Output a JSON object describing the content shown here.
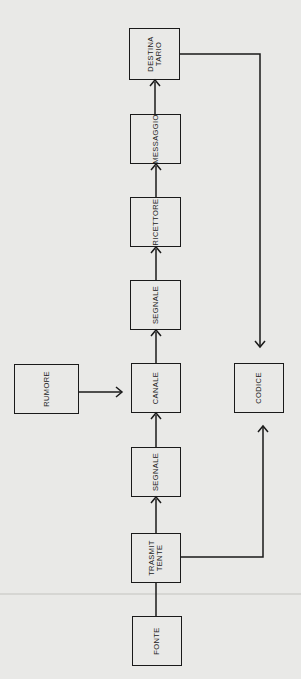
{
  "diagram": {
    "orientation": "rotated-90-ccw",
    "nodes": [
      {
        "id": "fonte",
        "label": [
          "FONTE"
        ],
        "x": 132,
        "y": 616,
        "w": 50,
        "h": 50
      },
      {
        "id": "trasmittente",
        "label": [
          "TRASMIT",
          "TENTE"
        ],
        "x": 131,
        "y": 533,
        "w": 50,
        "h": 50
      },
      {
        "id": "segnale1",
        "label": [
          "SEGNALE"
        ],
        "x": 131,
        "y": 447,
        "w": 50,
        "h": 50
      },
      {
        "id": "canale",
        "label": [
          "CANALE"
        ],
        "x": 131,
        "y": 363,
        "w": 50,
        "h": 50
      },
      {
        "id": "rumore",
        "label": [
          "RUMORE"
        ],
        "x": 14,
        "y": 364,
        "w": 65,
        "h": 50
      },
      {
        "id": "codice",
        "label": [
          "CODICE"
        ],
        "x": 234,
        "y": 363,
        "w": 50,
        "h": 50
      },
      {
        "id": "segnale2",
        "label": [
          "SEGNALE"
        ],
        "x": 130,
        "y": 280,
        "w": 51,
        "h": 50
      },
      {
        "id": "ricettore",
        "label": [
          "RICETTORE"
        ],
        "x": 130,
        "y": 197,
        "w": 51,
        "h": 50
      },
      {
        "id": "messaggio",
        "label": [
          "MESSAGGIO"
        ],
        "x": 130,
        "y": 114,
        "w": 51,
        "h": 50
      },
      {
        "id": "destinatario",
        "label": [
          "DESTINA",
          "TARIO"
        ],
        "x": 129,
        "y": 28,
        "w": 51,
        "h": 52
      }
    ],
    "edges": [
      {
        "from": "fonte",
        "to": "trasmittente",
        "arrow": false
      },
      {
        "from": "trasmittente",
        "to": "segnale1",
        "arrow": true
      },
      {
        "from": "segnale1",
        "to": "canale",
        "arrow": true
      },
      {
        "from": "rumore",
        "to": "canale",
        "arrow": true
      },
      {
        "from": "canale",
        "to": "segnale2",
        "arrow": true
      },
      {
        "from": "segnale2",
        "to": "ricettore",
        "arrow": true
      },
      {
        "from": "ricettore",
        "to": "messaggio",
        "arrow": true
      },
      {
        "from": "messaggio",
        "to": "destinatario",
        "arrow": true
      },
      {
        "from": "destinatario",
        "to": "codice",
        "arrow": true
      },
      {
        "from": "trasmittente",
        "to": "codice",
        "arrow": true
      }
    ]
  },
  "labels": {
    "fonte": [
      "FONTE"
    ],
    "trasmittente": [
      "TRASMIT",
      "TENTE"
    ],
    "segnale1": [
      "SEGNALE"
    ],
    "canale": [
      "CANALE"
    ],
    "rumore": [
      "RUMORE"
    ],
    "codice": [
      "CODICE"
    ],
    "segnale2": [
      "SEGNALE"
    ],
    "ricettore": [
      "RICETTORE"
    ],
    "messaggio": [
      "MESSAGGIO"
    ],
    "destinatario": [
      "DESTINA",
      "TARIO"
    ]
  },
  "colors": {
    "line": "#1a1a1a",
    "paper": "#e9e9e7"
  }
}
